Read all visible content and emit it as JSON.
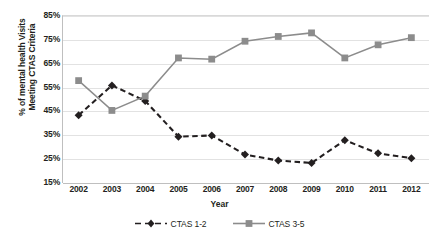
{
  "chart_data": {
    "type": "line",
    "title": "",
    "xlabel": "Year",
    "ylabel": "% of mental health Visits Meeting CTAS Criteria",
    "ylabel_lines": [
      "% of mental health Visits",
      "Meeting CTAS Criteria"
    ],
    "categories": [
      "2002",
      "2003",
      "2004",
      "2005",
      "2006",
      "2007",
      "2008",
      "2009",
      "2010",
      "2011",
      "2012"
    ],
    "x": [
      2002,
      2003,
      2004,
      2005,
      2006,
      2007,
      2008,
      2009,
      2010,
      2011,
      2012
    ],
    "ylim": [
      15,
      85
    ],
    "ytick_labels": [
      "85%",
      "75%",
      "65%",
      "55%",
      "45%",
      "35%",
      "25%",
      "15%"
    ],
    "ytick_values": [
      85,
      75,
      65,
      55,
      45,
      35,
      25,
      15
    ],
    "grid": true,
    "legend_position": "bottom",
    "series": [
      {
        "name": "CTAS 1-2",
        "values": [
          43,
          55.5,
          49,
          34,
          34.5,
          26.5,
          24,
          23,
          32.5,
          27,
          25
        ],
        "color": "#231f20",
        "line_style": "dashed",
        "marker": "diamond"
      },
      {
        "name": "CTAS 3-5",
        "values": [
          57.5,
          45,
          51,
          67,
          66.5,
          74,
          76,
          77.5,
          67,
          72.5,
          75.5
        ],
        "color": "#8c8c8c",
        "line_style": "solid",
        "marker": "square"
      }
    ]
  },
  "legend": {
    "items": [
      {
        "label": "CTAS 1-2",
        "icon": "dashed-line-diamond-marker-icon"
      },
      {
        "label": "CTAS 3-5",
        "icon": "solid-line-square-marker-icon"
      }
    ]
  },
  "colors": {
    "series_1": "#231f20",
    "series_2": "#8c8c8c",
    "gridline": "#e2e2e2",
    "axis": "#bfbfbf",
    "background": "#ffffff"
  }
}
